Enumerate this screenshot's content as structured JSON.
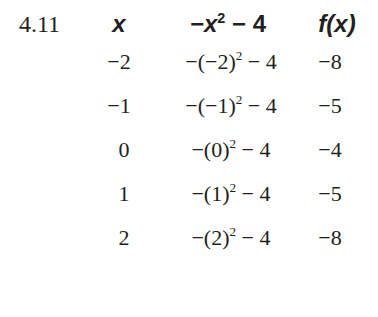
{
  "problem_number": "4.11",
  "table": {
    "headers": {
      "x": "x",
      "expr_prefix": "−x",
      "expr_exp": "2",
      "expr_suffix": " − 4",
      "f_prefix": "f",
      "f_arg": "(x)"
    },
    "rows": [
      {
        "x": "−2",
        "expr_base": "−(−2)",
        "expr_exp": "2",
        "expr_tail": " − 4",
        "f": "−8"
      },
      {
        "x": "−1",
        "expr_base": "−(−1)",
        "expr_exp": "2",
        "expr_tail": " − 4",
        "f": "−5"
      },
      {
        "x": "0",
        "expr_base": "−(0)",
        "expr_exp": "2",
        "expr_tail": " − 4",
        "f": "−4"
      },
      {
        "x": "1",
        "expr_base": "−(1)",
        "expr_exp": "2",
        "expr_tail": " − 4",
        "f": "−5"
      },
      {
        "x": "2",
        "expr_base": "−(2)",
        "expr_exp": "2",
        "expr_tail": " − 4",
        "f": "−8"
      }
    ]
  }
}
